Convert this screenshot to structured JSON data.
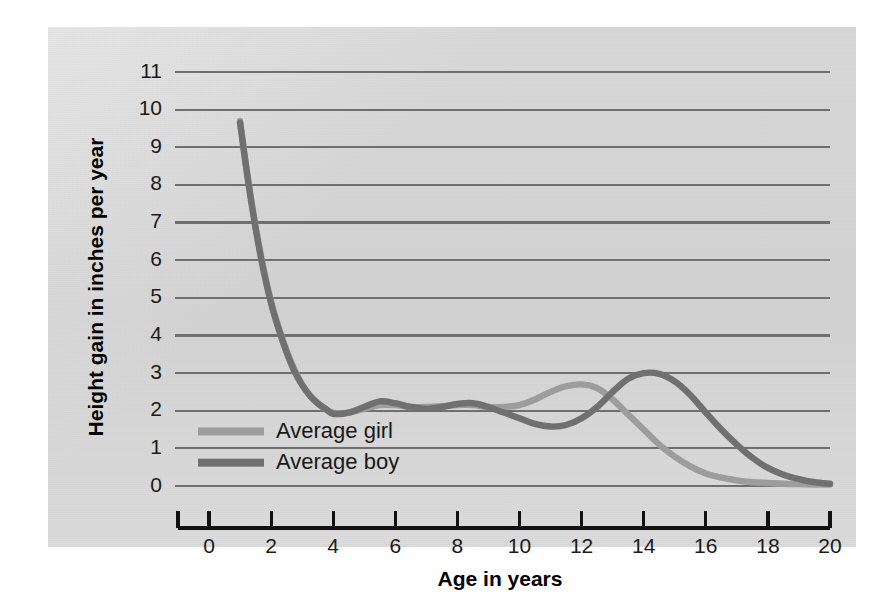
{
  "chart_data": {
    "type": "line",
    "title": "",
    "xlabel": "Age in years",
    "ylabel": "Height gain in inches per year",
    "xlim": [
      0,
      20
    ],
    "ylim": [
      0,
      11
    ],
    "grid": true,
    "legend_position": "inner-left",
    "xticks": [
      "0",
      "2",
      "4",
      "6",
      "8",
      "10",
      "12",
      "14",
      "16",
      "18",
      "20"
    ],
    "yticks": [
      "0",
      "1",
      "2",
      "3",
      "4",
      "5",
      "6",
      "7",
      "8",
      "9",
      "10",
      "11"
    ],
    "colors": {
      "girl": "#9d9d9d",
      "boy": "#707070",
      "gridline": "#6f6f6f",
      "axis": "#111111",
      "panel_background": "#d6d6d6"
    },
    "x": [
      1.0,
      1.25,
      1.5,
      1.75,
      2.0,
      2.25,
      2.5,
      2.75,
      3.0,
      3.25,
      3.5,
      3.75,
      4.0,
      4.5,
      5.0,
      5.5,
      6.0,
      6.5,
      7.0,
      7.5,
      8.0,
      8.5,
      9.0,
      9.5,
      10.0,
      10.5,
      11.0,
      11.5,
      12.0,
      12.5,
      13.0,
      13.5,
      14.0,
      14.5,
      15.0,
      15.5,
      16.0,
      16.5,
      17.0,
      17.5,
      18.0,
      18.5,
      19.0,
      19.5,
      20.0
    ],
    "series": [
      {
        "name": "Average girl",
        "values": [
          9.7,
          8.2,
          6.9,
          5.8,
          4.9,
          4.2,
          3.6,
          3.1,
          2.7,
          2.4,
          2.2,
          2.05,
          1.95,
          1.95,
          2.05,
          2.15,
          2.15,
          2.1,
          2.1,
          2.12,
          2.15,
          2.15,
          2.1,
          2.1,
          2.15,
          2.3,
          2.5,
          2.65,
          2.7,
          2.6,
          2.3,
          1.9,
          1.5,
          1.1,
          0.78,
          0.52,
          0.33,
          0.22,
          0.15,
          0.1,
          0.08,
          0.06,
          0.05,
          0.04,
          0.04
        ]
      },
      {
        "name": "Average boy",
        "values": [
          9.65,
          8.15,
          6.85,
          5.75,
          4.85,
          4.15,
          3.55,
          3.05,
          2.68,
          2.4,
          2.2,
          2.05,
          1.92,
          1.95,
          2.1,
          2.25,
          2.2,
          2.1,
          2.05,
          2.1,
          2.18,
          2.2,
          2.1,
          1.95,
          1.8,
          1.65,
          1.58,
          1.62,
          1.8,
          2.1,
          2.5,
          2.85,
          3.0,
          2.98,
          2.78,
          2.42,
          1.95,
          1.5,
          1.1,
          0.75,
          0.48,
          0.3,
          0.18,
          0.1,
          0.06
        ]
      }
    ],
    "annotations": [
      "Girl growth spurt peak near age 12 at about 2.7 inches per year",
      "Boy growth spurt peak near age 14 at about 3.0 inches per year",
      "Both curves start near 9.7 inches per year at age 1 and fall to a childhood low near 1.9 at age 4"
    ]
  }
}
